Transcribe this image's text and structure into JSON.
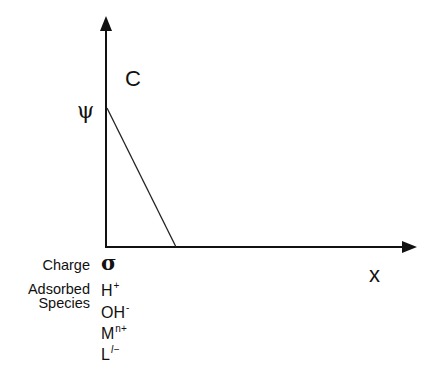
{
  "diagram": {
    "type": "concentration-profile",
    "y_axis_label": "C",
    "x_axis_label": "x",
    "origin_value_label": "ψ",
    "profile": {
      "description": "linear decrease of C from ψ at x=0 to zero",
      "start": {
        "x": 0,
        "y": "ψ"
      },
      "end": {
        "x": "small positive",
        "y": 0
      }
    },
    "charge_label": "Charge",
    "charge_symbol": "σ",
    "adsorbed_label_line1": "Adsorbed",
    "adsorbed_label_line2": "Species",
    "species": [
      {
        "base": "H",
        "sup": "+"
      },
      {
        "base": "OH",
        "sup": "-"
      },
      {
        "base": "M",
        "sup": "n+"
      },
      {
        "base": "L",
        "sup": "l−"
      }
    ],
    "colors": {
      "ink": "#111111",
      "background": "#ffffff"
    }
  }
}
